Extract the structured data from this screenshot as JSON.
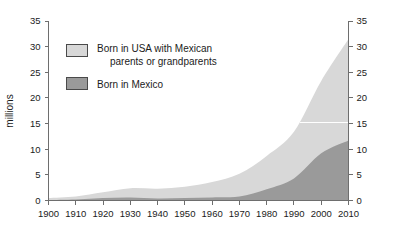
{
  "chart_data": {
    "type": "area",
    "stacked": true,
    "title": "",
    "subtitle": "",
    "xlabel": "",
    "ylabel": "millions",
    "xlim": [
      1900,
      2010
    ],
    "ylim": [
      0,
      35
    ],
    "grid": false,
    "legend_position": "inside-upper-left",
    "x": [
      1900,
      1910,
      1920,
      1930,
      1940,
      1950,
      1960,
      1970,
      1980,
      1990,
      2000,
      2010
    ],
    "xticks": [
      "1900",
      "1910",
      "1920",
      "1930",
      "1940",
      "1950",
      "1960",
      "1970",
      "1980",
      "1990",
      "2000",
      "2010"
    ],
    "yticks": [
      "0",
      "5",
      "10",
      "15",
      "20",
      "25",
      "30",
      "35"
    ],
    "yticks_right": [
      "0",
      "5",
      "10",
      "15",
      "20",
      "25",
      "30",
      "35"
    ],
    "series": [
      {
        "name": "Born in Mexico",
        "color": "#9a9a9a",
        "values": [
          0.1,
          0.2,
          0.5,
          0.6,
          0.4,
          0.5,
          0.6,
          0.8,
          2.2,
          4.3,
          9.2,
          11.7
        ]
      },
      {
        "name": "Born in USA with Mexican parents or grandparents",
        "color": "#d8d8d8",
        "values": [
          0.4,
          0.6,
          1.1,
          1.8,
          1.9,
          2.2,
          3.0,
          4.4,
          6.5,
          9.1,
          14.1,
          19.8
        ]
      }
    ],
    "totals": [
      0.5,
      0.8,
      1.6,
      2.4,
      2.3,
      2.7,
      3.6,
      5.2,
      8.7,
      13.4,
      23.3,
      31.5
    ]
  },
  "legend": {
    "items": [
      {
        "label_line1": "Born in USA with Mexican",
        "label_line2": "parents or grandparents",
        "color": "#d8d8d8"
      },
      {
        "label_line1": "Born in Mexico",
        "label_line2": "",
        "color": "#9a9a9a"
      }
    ]
  },
  "axes": {
    "y_title": "millions"
  },
  "colors": {
    "background": "#ffffff",
    "axis": "#6e6e6e",
    "text": "#1b1b1b",
    "band_top": "#d8d8d8",
    "band_bottom": "#9a9a9a",
    "swatch_border": "#4a4a4a"
  }
}
